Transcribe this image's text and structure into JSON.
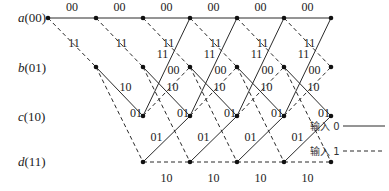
{
  "diagram": {
    "type": "trellis",
    "states": [
      {
        "id": "a",
        "name": "a",
        "bits": "(00)",
        "y": 18
      },
      {
        "id": "b",
        "name": "b",
        "bits": "(01)",
        "y": 67
      },
      {
        "id": "c",
        "name": "c",
        "bits": "(10)",
        "y": 116
      },
      {
        "id": "d",
        "name": "d",
        "bits": "(11)",
        "y": 162
      }
    ],
    "columns_x": [
      48,
      96,
      143,
      190,
      237,
      284,
      331
    ],
    "transitions": {
      "a_to_a": {
        "input": 0,
        "output": "00"
      },
      "a_to_b": {
        "input": 1,
        "output": "11"
      },
      "b_to_c": {
        "input": 0,
        "output": "10"
      },
      "b_to_d": {
        "input": 1,
        "output": "01"
      },
      "c_to_a": {
        "input": 0,
        "output": "11"
      },
      "c_to_b": {
        "input": 1,
        "output": "00"
      },
      "d_to_c": {
        "input": 0,
        "output": "01"
      },
      "d_to_d": {
        "input": 1,
        "output": "10"
      }
    },
    "legend": {
      "input0": {
        "label": "输入 0",
        "style": "solid"
      },
      "input1": {
        "label": "输入 1",
        "style": "dashed"
      }
    },
    "colors": {
      "line": "#2a2a2a",
      "node": "#111111",
      "text": "#222222"
    }
  }
}
